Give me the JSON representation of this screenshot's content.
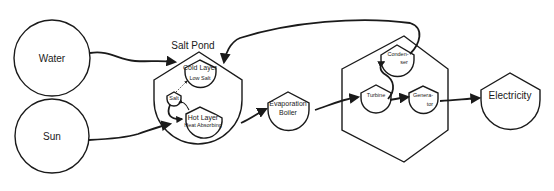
{
  "diagram": {
    "type": "flow",
    "nodes": {
      "water": {
        "label": "Water"
      },
      "sun": {
        "label": "Sun"
      },
      "salt_pond": {
        "label": "Salt Pond"
      },
      "cold_layer": {
        "label": "Cold Layer",
        "sublabel": "Low Salt"
      },
      "salt": {
        "label": "Salt"
      },
      "hot_layer": {
        "label": "Hot Layer",
        "sublabel": "Heat Absorbing"
      },
      "evaporation_boiler": {
        "label_line1": "Evaporation",
        "label_line2": "Boiler"
      },
      "condenser": {
        "label_line1": "Conden-",
        "label_line2": "ser"
      },
      "turbine": {
        "label": "Turbine"
      },
      "generator": {
        "label_line1": "Genera-",
        "label_line2": "tor"
      },
      "electricity": {
        "label": "Electricity"
      }
    },
    "edges": [
      {
        "from": "Water",
        "to": "Salt Pond"
      },
      {
        "from": "Sun",
        "to": "Salt Pond"
      },
      {
        "from": "Salt Pond",
        "to": "Evaporation Boiler"
      },
      {
        "from": "Evaporation Boiler",
        "to": "Turbine"
      },
      {
        "from": "Turbine",
        "to": "Generator"
      },
      {
        "from": "Turbine",
        "to": "Condenser"
      },
      {
        "from": "Condenser",
        "to": "Salt Pond"
      },
      {
        "from": "Generator",
        "to": "Electricity"
      },
      {
        "from": "Salt",
        "to": "Hot Layer"
      },
      {
        "from": "Hot Layer",
        "to": "Salt"
      },
      {
        "from": "Salt",
        "to": "Cold Layer"
      }
    ]
  }
}
